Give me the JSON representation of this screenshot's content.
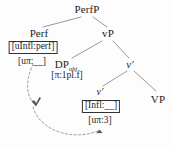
{
  "figure": {
    "type": "syntactic-tree"
  },
  "nodes": {
    "perfp": {
      "label": "PerfP",
      "x": 87,
      "y": 6
    },
    "perf": {
      "label": "Perf",
      "x": 39,
      "y": 30
    },
    "vp_big": {
      "label": "vP",
      "x": 108,
      "y": 30
    },
    "dp_obj": {
      "label": "DP",
      "sub": "obj",
      "x": 66,
      "y": 62
    },
    "v_bar": {
      "label": "v",
      "prime": "′",
      "x": 130,
      "y": 62
    },
    "v_small": {
      "label": "v",
      "prime": "′",
      "x": 100,
      "y": 90
    },
    "vp_small": {
      "label": "VP",
      "x": 158,
      "y": 97
    }
  },
  "boxes": {
    "perf_feature": {
      "text": "[uInfl:perf]",
      "x": 33,
      "y": 42
    },
    "v_feature": {
      "text": "[Infl:__]",
      "x": 101,
      "y": 101
    }
  },
  "features": {
    "perf_phi": {
      "text": "[uπ:__]",
      "x": 32,
      "y": 57
    },
    "dp_phi": {
      "text": "[π:1pl.f]",
      "x": 67,
      "y": 72
    },
    "v_phi": {
      "text": "[uπ:3]",
      "x": 100,
      "y": 116
    }
  },
  "branches": [
    {
      "name": "perfp-to-perf",
      "x1": 81,
      "y1": 17,
      "x2": 43,
      "y2": 27
    },
    {
      "name": "perfp-to-vp",
      "x1": 93,
      "y1": 17,
      "x2": 107,
      "y2": 27
    },
    {
      "name": "vp-to-dpobj",
      "x1": 102,
      "y1": 41,
      "x2": 72,
      "y2": 58
    },
    {
      "name": "vp-to-vbar",
      "x1": 113,
      "y1": 41,
      "x2": 129,
      "y2": 58
    },
    {
      "name": "vbar-to-v",
      "x1": 127,
      "y1": 71,
      "x2": 103,
      "y2": 86
    },
    {
      "name": "vbar-to-vp-small",
      "x1": 134,
      "y1": 71,
      "x2": 156,
      "y2": 91
    }
  ],
  "agree_arrows": [
    {
      "name": "infl-valuation-arrow",
      "path": "M 33 64 C 26 82, 27 96, 36 105",
      "arrowhead": {
        "x": 36,
        "y": 105,
        "angle": 48
      }
    },
    {
      "name": "phi-valuation-arrow",
      "path": "M 34 106 C 42 130, 72 140, 99 130",
      "arrowhead": {
        "x": 99,
        "y": 130,
        "angle": -70
      }
    }
  ],
  "colors": {
    "ink": "#1c1c1c",
    "line": "#8d8d8d",
    "dashed": "#8a8a8a",
    "box_border": "#333333",
    "background": "#fdfdfd"
  }
}
